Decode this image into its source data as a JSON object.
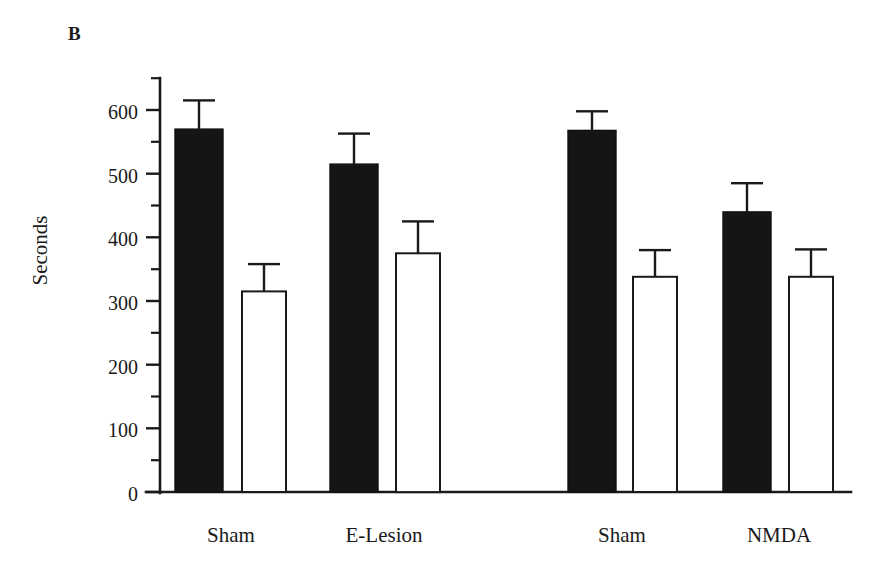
{
  "figure": {
    "panel_label": "B",
    "background_color": "#ffffff",
    "ink_color": "#1a1a1a"
  },
  "chart_data": {
    "type": "bar",
    "title": "",
    "subtitle": "",
    "panel": "B",
    "xlabel": "",
    "ylabel": "Seconds",
    "ylim": [
      0,
      600
    ],
    "ytick_labels": [
      "0",
      "100",
      "200",
      "300",
      "400",
      "500",
      "600"
    ],
    "ytick_values": [
      0,
      100,
      200,
      300,
      400,
      500,
      600
    ],
    "yminor_step": 50,
    "grid": false,
    "legend_position": "none",
    "categories": [
      "Sham",
      "E-Lesion",
      "Sham",
      "NMDA"
    ],
    "series": [
      {
        "name": "Filled",
        "fill": "#151515",
        "values": [
          570,
          515,
          568,
          440
        ],
        "errors": [
          45,
          48,
          30,
          45
        ]
      },
      {
        "name": "Open",
        "fill": "#ffffff",
        "values": [
          315,
          375,
          338,
          338
        ],
        "errors": [
          43,
          50,
          42,
          43
        ]
      }
    ],
    "bars": [
      {
        "group": "Sham",
        "series": "Filled",
        "value": 570,
        "error_high": 615,
        "error_low": 525
      },
      {
        "group": "Sham",
        "series": "Open",
        "value": 315,
        "error_high": 358,
        "error_low": 272
      },
      {
        "group": "E-Lesion",
        "series": "Filled",
        "value": 515,
        "error_high": 563,
        "error_low": 467
      },
      {
        "group": "E-Lesion",
        "series": "Open",
        "value": 375,
        "error_high": 425,
        "error_low": 325
      },
      {
        "group": "Sham",
        "series": "Filled",
        "value": 568,
        "error_high": 598,
        "error_low": 538
      },
      {
        "group": "Sham",
        "series": "Open",
        "value": 338,
        "error_high": 380,
        "error_low": 296
      },
      {
        "group": "NMDA",
        "series": "Filled",
        "value": 440,
        "error_high": 485,
        "error_low": 395
      },
      {
        "group": "NMDA",
        "series": "Open",
        "value": 338,
        "error_high": 381,
        "error_low": 295
      }
    ]
  },
  "axis": {
    "y_title": "Seconds",
    "tick0": "0",
    "tick1": "100",
    "tick2": "200",
    "tick3": "300",
    "tick4": "400",
    "tick5": "500",
    "tick6": "600"
  },
  "xaxis": {
    "label0": "Sham",
    "label1": "E-Lesion",
    "label2": "Sham",
    "label3": "NMDA"
  }
}
